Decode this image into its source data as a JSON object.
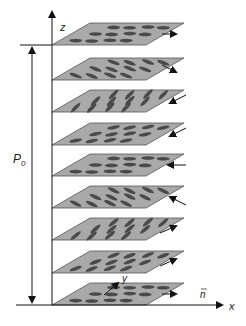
{
  "diagram": {
    "type": "cholesteric-liquid-crystal-helix",
    "labels": {
      "z_axis": "z",
      "x_axis": "x",
      "y_axis": "y",
      "pitch": "P",
      "pitch_subscript": "0",
      "director": "n"
    },
    "colors": {
      "plane_fill": "#a9a9a9",
      "plane_stroke": "#555555",
      "molecule": "#4a4a4a",
      "axis": "#111111"
    },
    "layers": [
      {
        "y": 305,
        "angle": 0,
        "arrow": "right"
      },
      {
        "y": 273,
        "angle": -20,
        "arrow": "right-up"
      },
      {
        "y": 240,
        "angle": -40,
        "arrow": "right-up"
      },
      {
        "y": 208,
        "angle": 25,
        "arrow": "left-up"
      },
      {
        "y": 176,
        "angle": 0,
        "arrow": "left"
      },
      {
        "y": 145,
        "angle": -12,
        "arrow": "left-down"
      },
      {
        "y": 112,
        "angle": -45,
        "arrow": "left-down"
      },
      {
        "y": 80,
        "angle": 20,
        "arrow": "right-down"
      },
      {
        "y": 45,
        "angle": 0,
        "arrow": "right"
      }
    ]
  }
}
